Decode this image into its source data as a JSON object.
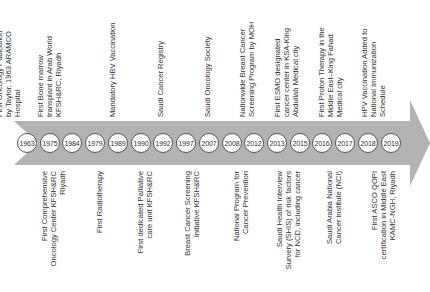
{
  "colors": {
    "band": "#b3b3b3",
    "circle_border": "#555555",
    "text": "#333333"
  },
  "timeline": {
    "years": [
      "1963",
      "1975",
      "1984",
      "1979",
      "1989",
      "1990",
      "1992",
      "1997",
      "2007",
      "2008",
      "2012",
      "2013",
      "2015",
      "2016",
      "2017",
      "2018",
      "2019"
    ],
    "top_events": [
      {
        "year": "1963",
        "lines": [
          "First Oncology Pubication",
          "by Taylor, 1963 ARAMCO",
          "Hospital"
        ]
      },
      {
        "year": "1984",
        "lines": [
          "First Bone marrow",
          "transplant in Arab World",
          "KFSH&RC, Riyadh"
        ]
      },
      {
        "year": "1989",
        "lines": [
          "Mandatory HBV Vaccination"
        ]
      },
      {
        "year": "1992",
        "lines": [
          "Saudi Cancer Registry"
        ]
      },
      {
        "year": "2007",
        "lines": [
          "Saudi Oncology Society"
        ]
      },
      {
        "year": "2012",
        "lines": [
          "Nationwide Breast Cancer",
          "Screening Program by MOH"
        ]
      },
      {
        "year": "2015",
        "lines": [
          "First ESMO designated",
          "cancer center in KSA-King",
          "Abdullah Medical city"
        ]
      },
      {
        "year": "2017",
        "lines": [
          "First Proton Therapy in the",
          "Middle East–King Fahad",
          "Medical city"
        ]
      },
      {
        "year": "2019",
        "lines": [
          "HPV Vaccination Added to",
          "National Immunization",
          "Schedule"
        ]
      }
    ],
    "bottom_events": [
      {
        "year": "1975",
        "lines": [
          "First Comprehensive",
          "Oncology Center KFSH&RC",
          "Riyadh"
        ]
      },
      {
        "year": "1979",
        "lines": [
          "First Radiotherapy"
        ]
      },
      {
        "year": "1990",
        "lines": [
          "First dedicated Palliative",
          "care unit KFSH&RC"
        ]
      },
      {
        "year": "1997",
        "lines": [
          "Breast Cancer Screening",
          "Initiative KFSH&RC"
        ]
      },
      {
        "year": "2008",
        "lines": [
          "National Program for",
          "Cancer Prevention"
        ]
      },
      {
        "year": "2013",
        "lines": [
          "Saudi Health Interview",
          "Survery (SHIS) of risk factors",
          "for NCD, including cancer"
        ]
      },
      {
        "year": "2016",
        "lines": [
          "Saudi Arabia National",
          "Cancer institute (NCI)"
        ]
      },
      {
        "year": "2018",
        "lines": [
          "First ASCO QOPI",
          "certification in Middle East",
          "KAMC-NGH, Riyadh"
        ]
      }
    ]
  }
}
